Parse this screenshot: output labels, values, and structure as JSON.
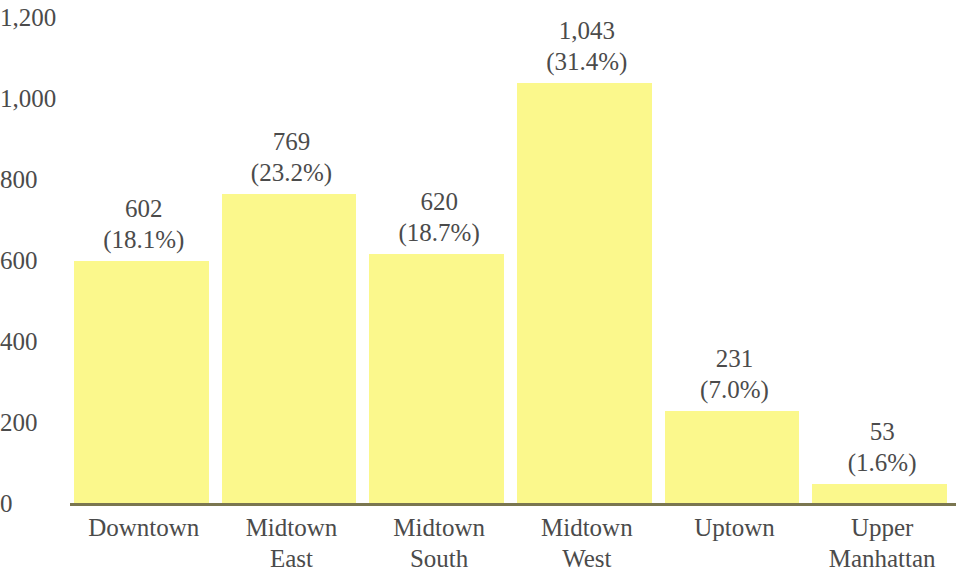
{
  "chart_data": {
    "type": "bar",
    "title": "",
    "subtitle": "",
    "xlabel": "",
    "ylabel": "",
    "categories": [
      "Downtown",
      "Midtown East",
      "Midtown South",
      "Midtown West",
      "Uptown",
      "Upper Manhattan"
    ],
    "category_lines": [
      [
        "Downtown"
      ],
      [
        "Midtown",
        "East"
      ],
      [
        "Midtown",
        "South"
      ],
      [
        "Midtown",
        "West"
      ],
      [
        "Uptown"
      ],
      [
        "Upper",
        "Manhattan"
      ]
    ],
    "values": [
      602,
      769,
      620,
      1043,
      231,
      53
    ],
    "percents": [
      18.1,
      23.2,
      18.7,
      31.4,
      7.0,
      1.6
    ],
    "value_labels": [
      "602",
      "769",
      "620",
      "1,043",
      "231",
      "53"
    ],
    "percent_labels": [
      "(18.1%)",
      "(23.2%)",
      "(18.7%)",
      "(31.4%)",
      "(7.0%)",
      "(1.6%)"
    ],
    "ylim": [
      0,
      1200
    ],
    "ytick_values": [
      0,
      200,
      400,
      600,
      800,
      1000,
      1200
    ],
    "ytick_labels": [
      "0",
      "200",
      "400",
      "600",
      "800",
      "1,000",
      "1,200"
    ],
    "grid": false,
    "legend": null,
    "legend_position": "none",
    "bar_color": "#fbf88c",
    "axis_color": "#7a7650",
    "text_color": "#4b4b4b",
    "background_color": "#ffffff"
  }
}
